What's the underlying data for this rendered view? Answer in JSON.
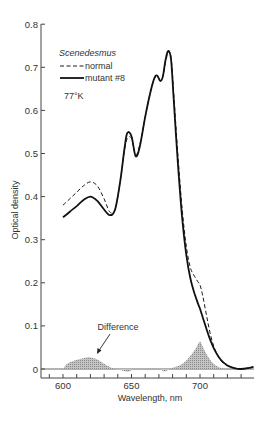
{
  "chart_data": {
    "type": "line",
    "title": "",
    "xlabel": "Wavelength, nm",
    "ylabel": "Optical density",
    "xlim": [
      584,
      739
    ],
    "ylim": [
      0,
      0.8
    ],
    "x_ticks": [
      600,
      650,
      700
    ],
    "x_minor_tick_step": 10,
    "y_ticks": [
      0,
      0.1,
      0.2,
      0.3,
      0.4,
      0.5,
      0.6,
      0.7,
      0.8
    ],
    "y_tick_labels": [
      "0",
      "0.1",
      "0.2",
      "0.3",
      "0.4",
      "0.5",
      "0.6",
      "0.7",
      "0.8"
    ],
    "grid": false,
    "legend": {
      "title": "Scenedesmus",
      "entries": [
        {
          "label": "normal",
          "style": "dashed"
        },
        {
          "label": "mutant #8",
          "style": "solid"
        }
      ],
      "condition": "77°K",
      "position": "upper-left"
    },
    "annotations": [
      {
        "text": "Difference",
        "points_to": "difference area near 620 nm"
      }
    ],
    "series": [
      {
        "name": "normal",
        "style": "dashed",
        "x": [
          600,
          605,
          610,
          615,
          620,
          625,
          630,
          634,
          638,
          642,
          645,
          647,
          650,
          653,
          656,
          660,
          664,
          667,
          669,
          671,
          673,
          675,
          677,
          679,
          681,
          684,
          687,
          690,
          693,
          696,
          699,
          700,
          702,
          705,
          708,
          711,
          715,
          720,
          725,
          730,
          735,
          739
        ],
        "y": [
          0.38,
          0.395,
          0.41,
          0.425,
          0.434,
          0.425,
          0.395,
          0.365,
          0.37,
          0.44,
          0.51,
          0.535,
          0.535,
          0.497,
          0.52,
          0.585,
          0.645,
          0.675,
          0.678,
          0.67,
          0.68,
          0.715,
          0.737,
          0.72,
          0.63,
          0.49,
          0.37,
          0.285,
          0.235,
          0.215,
          0.2,
          0.195,
          0.17,
          0.12,
          0.075,
          0.045,
          0.02,
          0.008,
          0.002,
          0.0,
          0.002,
          0.005
        ]
      },
      {
        "name": "mutant #8",
        "style": "solid",
        "x": [
          600,
          605,
          610,
          615,
          620,
          625,
          630,
          634,
          638,
          642,
          645,
          647,
          650,
          653,
          656,
          660,
          664,
          667,
          669,
          671,
          673,
          675,
          677,
          679,
          681,
          684,
          687,
          690,
          693,
          696,
          699,
          700,
          702,
          705,
          708,
          711,
          715,
          720,
          725,
          730,
          735,
          739
        ],
        "y": [
          0.352,
          0.365,
          0.378,
          0.392,
          0.4,
          0.39,
          0.37,
          0.357,
          0.37,
          0.44,
          0.515,
          0.548,
          0.54,
          0.494,
          0.515,
          0.585,
          0.645,
          0.677,
          0.68,
          0.668,
          0.68,
          0.72,
          0.738,
          0.715,
          0.615,
          0.47,
          0.35,
          0.265,
          0.21,
          0.175,
          0.148,
          0.14,
          0.12,
          0.09,
          0.063,
          0.042,
          0.022,
          0.008,
          0.002,
          0.0,
          0.002,
          0.005
        ]
      },
      {
        "name": "Difference",
        "style": "hatched-area",
        "x": [
          600,
          603,
          607,
          611,
          615,
          620,
          625,
          630,
          634,
          638,
          644,
          648,
          652,
          658,
          670,
          674,
          678,
          682,
          686,
          690,
          694,
          697,
          700,
          703,
          706,
          710,
          714,
          718
        ],
        "y": [
          0.0,
          0.012,
          0.018,
          0.022,
          0.025,
          0.027,
          0.022,
          0.012,
          0.005,
          0.0,
          -0.004,
          -0.006,
          0.0,
          0.0,
          0.0,
          -0.006,
          0.0,
          0.005,
          0.01,
          0.02,
          0.035,
          0.048,
          0.063,
          0.045,
          0.028,
          0.012,
          0.004,
          0.0
        ]
      }
    ]
  },
  "axes": {
    "x_tick_labels": [
      "600",
      "650",
      "700"
    ],
    "xlabel": "Wavelength, nm",
    "ylabel": "Optical density"
  },
  "legend": {
    "title": "Scenedesmus",
    "normal_label": "normal",
    "mutant_label": "mutant #8",
    "condition": "77°K"
  },
  "annotation": {
    "difference_label": "Difference"
  },
  "colors": {
    "line": "#1a1a1a",
    "axis": "#444444",
    "difference_fill": "#b5b5b5"
  }
}
